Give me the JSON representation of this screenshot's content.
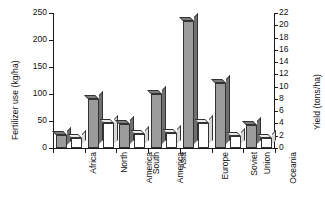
{
  "chart_data": {
    "type": "bar",
    "title": "",
    "categories": [
      "Africa",
      "North America",
      "South America",
      "Asia",
      "Europe",
      "Soviet Union",
      "Oceania"
    ],
    "category_lines": [
      [
        "Africa"
      ],
      [
        "North",
        "America"
      ],
      [
        "South",
        "America"
      ],
      [
        "Asia"
      ],
      [
        "Europe"
      ],
      [
        "Soviet",
        "Union"
      ],
      [
        "Oceania"
      ]
    ],
    "series": [
      {
        "name": "Fertilizer use",
        "axis": "left",
        "unit": "kg/ha",
        "style": "gray-3d-bar",
        "color": "#9b9b9b",
        "values": [
          25,
          90,
          45,
          100,
          235,
          120,
          42
        ]
      },
      {
        "name": "Yield",
        "axis": "right",
        "unit": "tons/ha",
        "style": "white-3d-bar",
        "color": "#ffffff",
        "values": [
          1.7,
          4.0,
          2.3,
          2.4,
          4.0,
          1.9,
          1.7
        ]
      }
    ],
    "xlabel": "",
    "ylabel_left": "Fertilizer use (kg/ha)",
    "ylabel_right": "Yield (tons/ha)",
    "ylim_left": [
      0,
      250
    ],
    "ylim_right": [
      0,
      22
    ],
    "yticks_left": [
      0,
      50,
      100,
      150,
      200,
      250
    ],
    "yticks_right": [
      0,
      2,
      4,
      6,
      8,
      10,
      12,
      14,
      16,
      18,
      20,
      22
    ],
    "grid": false,
    "legend": "none"
  },
  "axes": {
    "left_title": "Fertilizer use (kg/ha)",
    "right_title": "Yield (tons/ha)",
    "left_ticks": [
      "0",
      "50",
      "100",
      "150",
      "200",
      "250"
    ],
    "right_ticks": [
      "0",
      "2",
      "4",
      "6",
      "8",
      "10",
      "12",
      "14",
      "16",
      "18",
      "20",
      "22"
    ]
  }
}
